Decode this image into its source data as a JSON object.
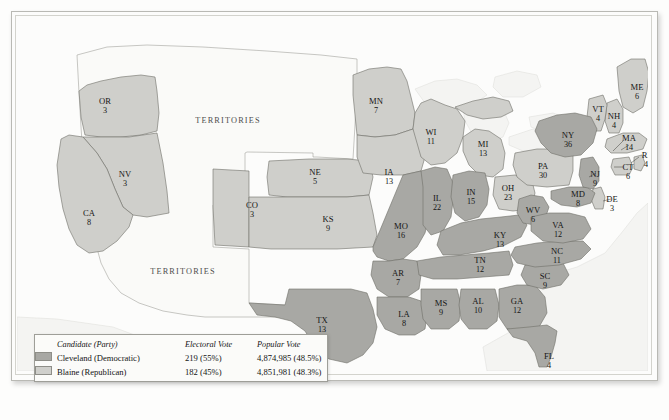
{
  "map": {
    "title": "United States Presidential Election 1884 Electoral Map",
    "territory_labels": [
      "TERRITORIES",
      "TERRITORIES"
    ],
    "colors": {
      "democratic_fill": "#a8a8a4",
      "republican_fill": "#cfcfcb",
      "territory_fill": "#fafaf8",
      "water_fill": "#f4f4f2",
      "state_border": "#6e6e68",
      "frame": "#b9b9b4"
    },
    "states": [
      {
        "ab": "OR",
        "ev": "3",
        "party": "rep",
        "x": 88,
        "y": 87
      },
      {
        "ab": "NV",
        "ev": "3",
        "party": "rep",
        "x": 108,
        "y": 160
      },
      {
        "ab": "CA",
        "ev": "8",
        "party": "rep",
        "x": 72,
        "y": 199
      },
      {
        "ab": "CO",
        "ev": "3",
        "party": "rep",
        "x": 235,
        "y": 191
      },
      {
        "ab": "NE",
        "ev": "5",
        "party": "rep",
        "x": 298,
        "y": 158
      },
      {
        "ab": "KS",
        "ev": "9",
        "party": "rep",
        "x": 311,
        "y": 205
      },
      {
        "ab": "TX",
        "ev": "13",
        "party": "dem",
        "x": 305,
        "y": 306
      },
      {
        "ab": "MN",
        "ev": "7",
        "party": "rep",
        "x": 359,
        "y": 87
      },
      {
        "ab": "IA",
        "ev": "13",
        "party": "rep",
        "x": 372,
        "y": 158
      },
      {
        "ab": "MO",
        "ev": "16",
        "party": "dem",
        "x": 384,
        "y": 212
      },
      {
        "ab": "AR",
        "ev": "7",
        "party": "dem",
        "x": 381,
        "y": 259
      },
      {
        "ab": "LA",
        "ev": "8",
        "party": "dem",
        "x": 387,
        "y": 300
      },
      {
        "ab": "WI",
        "ev": "11",
        "party": "rep",
        "x": 414,
        "y": 118
      },
      {
        "ab": "IL",
        "ev": "22",
        "party": "dem",
        "x": 420,
        "y": 184
      },
      {
        "ab": "MS",
        "ev": "9",
        "party": "dem",
        "x": 424,
        "y": 289
      },
      {
        "ab": "MI",
        "ev": "13",
        "party": "rep",
        "x": 466,
        "y": 130
      },
      {
        "ab": "IN",
        "ev": "15",
        "party": "dem",
        "x": 454,
        "y": 178
      },
      {
        "ab": "AL",
        "ev": "10",
        "party": "dem",
        "x": 461,
        "y": 287
      },
      {
        "ab": "TN",
        "ev": "12",
        "party": "dem",
        "x": 463,
        "y": 246
      },
      {
        "ab": "KY",
        "ev": "13",
        "party": "dem",
        "x": 483,
        "y": 221
      },
      {
        "ab": "OH",
        "ev": "23",
        "party": "rep",
        "x": 491,
        "y": 174
      },
      {
        "ab": "GA",
        "ev": "12",
        "party": "dem",
        "x": 500,
        "y": 287
      },
      {
        "ab": "FL",
        "ev": "4",
        "party": "dem",
        "x": 532,
        "y": 342
      },
      {
        "ab": "SC",
        "ev": "9",
        "party": "dem",
        "x": 528,
        "y": 262
      },
      {
        "ab": "NC",
        "ev": "11",
        "party": "dem",
        "x": 540,
        "y": 237
      },
      {
        "ab": "WV",
        "ev": "6",
        "party": "dem",
        "x": 516,
        "y": 196
      },
      {
        "ab": "VA",
        "ev": "12",
        "party": "dem",
        "x": 541,
        "y": 211
      },
      {
        "ab": "PA",
        "ev": "30",
        "party": "rep",
        "x": 526,
        "y": 152
      },
      {
        "ab": "MD",
        "ev": "8",
        "party": "dem",
        "x": 561,
        "y": 180
      },
      {
        "ab": "DE",
        "ev": "3",
        "party": "rep",
        "x": 595,
        "y": 185
      },
      {
        "ab": "NJ",
        "ev": "9",
        "party": "dem",
        "x": 578,
        "y": 160
      },
      {
        "ab": "NY",
        "ev": "36",
        "party": "dem",
        "x": 551,
        "y": 121
      },
      {
        "ab": "CT",
        "ev": "6",
        "party": "rep",
        "x": 611,
        "y": 153
      },
      {
        "ab": "RI",
        "ev": "4",
        "party": "rep",
        "x": 629,
        "y": 141
      },
      {
        "ab": "MA",
        "ev": "14",
        "party": "rep",
        "x": 612,
        "y": 124
      },
      {
        "ab": "NH",
        "ev": "4",
        "party": "rep",
        "x": 597,
        "y": 102
      },
      {
        "ab": "VT",
        "ev": "4",
        "party": "rep",
        "x": 581,
        "y": 95
      },
      {
        "ab": "ME",
        "ev": "6",
        "party": "rep",
        "x": 620,
        "y": 73
      }
    ]
  },
  "legend": {
    "headers": {
      "candidate": "Candidate (Party)",
      "electoral": "Electoral Vote",
      "popular": "Popular Vote"
    },
    "rows": [
      {
        "party_key": "dem",
        "candidate": "Cleveland (Democratic)",
        "electoral": "219 (55%)",
        "popular": "4,874,985 (48.5%)"
      },
      {
        "party_key": "rep",
        "candidate": "Blaine (Republican)",
        "electoral": "182 (45%)",
        "popular": "4,851,981 (48.3%)"
      }
    ]
  }
}
